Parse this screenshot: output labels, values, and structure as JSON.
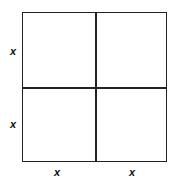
{
  "diagram": {
    "type": "2x2 square grid",
    "labels": {
      "left": [
        "x",
        "x"
      ],
      "bottom": [
        "x",
        "x"
      ]
    },
    "line_color": "#222222"
  }
}
